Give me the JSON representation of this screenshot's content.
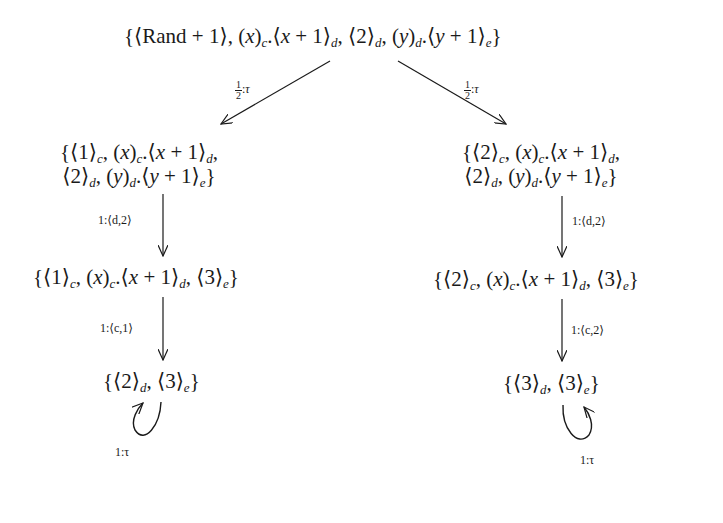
{
  "diagram": {
    "type": "probabilistic-transition-graph",
    "nodes": {
      "root": {
        "text": "{⟨Rand + 1⟩, (x)c.⟨x + 1⟩d, ⟨2⟩d, (y)d.⟨y + 1⟩e}"
      },
      "left1": {
        "line1": "{⟨1⟩c, (x)c.⟨x + 1⟩d,",
        "line2": "⟨2⟩d, (y)d.⟨y + 1⟩e}"
      },
      "right1": {
        "line1": "{⟨2⟩c, (x)c.⟨x + 1⟩d,",
        "line2": "⟨2⟩d, (y)d.⟨y + 1⟩e}"
      },
      "left2": {
        "text": "{⟨1⟩c, (x)c.⟨x + 1⟩d, ⟨3⟩e}"
      },
      "right2": {
        "text": "{⟨2⟩c, (x)c.⟨x + 1⟩d, ⟨3⟩e}"
      },
      "left3": {
        "text": "{⟨2⟩d, ⟨3⟩e}"
      },
      "right3": {
        "text": "{⟨3⟩d, ⟨3⟩e}"
      }
    },
    "edges": [
      {
        "from": "root",
        "to": "left1",
        "prob_num": "1",
        "prob_den": "2",
        "action": "τ"
      },
      {
        "from": "root",
        "to": "right1",
        "prob_num": "1",
        "prob_den": "2",
        "action": "τ"
      },
      {
        "from": "left1",
        "to": "left2",
        "label": "1:⟨d,2⟩"
      },
      {
        "from": "right1",
        "to": "right2",
        "label": "1:⟨d,2⟩"
      },
      {
        "from": "left2",
        "to": "left3",
        "label": "1:⟨c,1⟩"
      },
      {
        "from": "right2",
        "to": "right3",
        "label": "1:⟨c,2⟩"
      },
      {
        "from": "left3",
        "to": "left3",
        "label": "1:τ"
      },
      {
        "from": "right3",
        "to": "right3",
        "label": "1:τ"
      }
    ]
  }
}
